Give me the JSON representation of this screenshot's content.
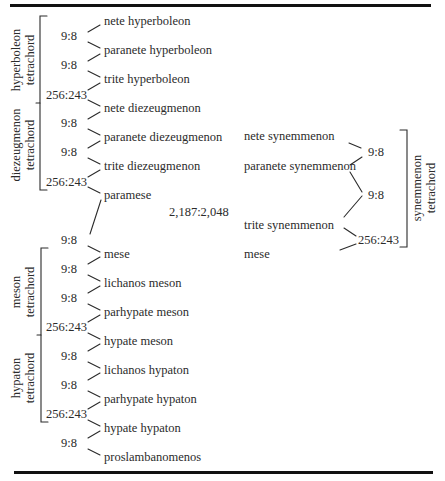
{
  "diagram": {
    "left_column": {
      "notes": [
        {
          "label": "nete hyperboleon",
          "y": 15
        },
        {
          "label": "paranete hyperboleon",
          "y": 44
        },
        {
          "label": "trite hyperboleon",
          "y": 73
        },
        {
          "label": "nete diezeugmenon",
          "y": 102
        },
        {
          "label": "paranete diezeugmenon",
          "y": 131
        },
        {
          "label": "trite diezeugmenon",
          "y": 160
        },
        {
          "label": "paramese",
          "y": 189
        },
        {
          "label": "mese",
          "y": 248
        },
        {
          "label": "lichanos meson",
          "y": 277
        },
        {
          "label": "parhypate meson",
          "y": 306
        },
        {
          "label": "hypate meson",
          "y": 335
        },
        {
          "label": "lichanos hypaton",
          "y": 364
        },
        {
          "label": "parhypate hypaton",
          "y": 393
        },
        {
          "label": "hypate hypaton",
          "y": 422
        },
        {
          "label": "proslambanomenos",
          "y": 451
        }
      ],
      "intervals": [
        {
          "ratio": "9:8",
          "y": 30
        },
        {
          "ratio": "9:8",
          "y": 59
        },
        {
          "ratio": "256:243",
          "y": 88
        },
        {
          "ratio": "9:8",
          "y": 117
        },
        {
          "ratio": "9:8",
          "y": 146
        },
        {
          "ratio": "256:243",
          "y": 175
        },
        {
          "ratio": "9:8",
          "y": 233
        },
        {
          "ratio": "9:8",
          "y": 262
        },
        {
          "ratio": "9:8",
          "y": 291
        },
        {
          "ratio": "256:243",
          "y": 320
        },
        {
          "ratio": "9:8",
          "y": 349
        },
        {
          "ratio": "9:8",
          "y": 378
        },
        {
          "ratio": "256:243",
          "y": 407
        },
        {
          "ratio": "9:8",
          "y": 436
        }
      ],
      "tetrachords": [
        {
          "line1": "hyperboleon",
          "line2": "tetrachord"
        },
        {
          "line1": "diezeugmenon",
          "line2": "tetrachord"
        },
        {
          "line1": "meson",
          "line2": "tetrachord"
        },
        {
          "line1": "hypaton",
          "line2": "tetrachord"
        }
      ]
    },
    "center": {
      "disjunction_ratio": "2,187:2,048"
    },
    "right_column": {
      "notes": [
        {
          "label": "nete synemmenon"
        },
        {
          "label": "paranete synemmenon"
        },
        {
          "label": "trite synemmenon"
        },
        {
          "label": "mese"
        }
      ],
      "intervals": [
        {
          "ratio": "9:8"
        },
        {
          "ratio": "9:8"
        },
        {
          "ratio": "256:243"
        }
      ],
      "tetrachord": {
        "line1": "synemmenon",
        "line2": "tetrachord"
      }
    }
  }
}
